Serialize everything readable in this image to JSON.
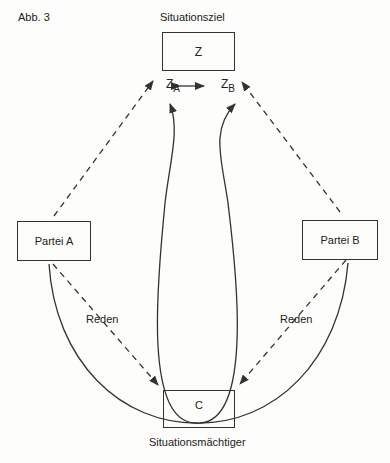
{
  "figure_label": "Abb. 3",
  "nodes": {
    "goal": {
      "title": "Situationsziel",
      "label": "Z"
    },
    "party_a": {
      "label": "Partei A"
    },
    "party_b": {
      "label": "Partei B"
    },
    "mediator": {
      "title": "Situationsmächtiger",
      "label": "C"
    }
  },
  "goal_parts": {
    "a": {
      "base": "Z",
      "sub": "A"
    },
    "b": {
      "base": "Z",
      "sub": "B"
    }
  },
  "edges": {
    "talk_a": "Reden",
    "talk_b": "Reden"
  },
  "colors": {
    "line": "#333333",
    "background": "#fdfdfb"
  }
}
